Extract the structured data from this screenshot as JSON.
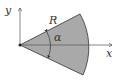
{
  "diagram": {
    "type": "circular-sector",
    "labels": {
      "y_axis": "y",
      "x_axis": "x",
      "radius": "R",
      "angle": "α"
    },
    "colors": {
      "sector_fill": "#a9a9a9",
      "lines": "#333333",
      "background": "#ffffff"
    }
  }
}
